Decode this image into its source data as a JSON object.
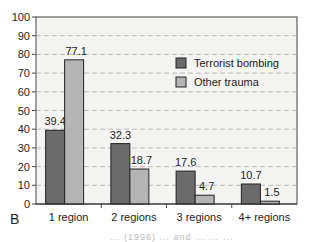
{
  "chart_data": {
    "type": "bar",
    "title": "",
    "xlabel": "",
    "ylabel": "",
    "ylim": [
      0,
      100
    ],
    "yticks": [
      0,
      10,
      20,
      30,
      40,
      50,
      60,
      70,
      80,
      90,
      100
    ],
    "grid": true,
    "legend_position": "upper right",
    "categories": [
      "1 region",
      "2 regions",
      "3 regions",
      "4+ regions"
    ],
    "series": [
      {
        "name": "Terrorist bombing",
        "color": "#6b6b6b",
        "values": [
          39.4,
          32.3,
          17.6,
          10.7
        ]
      },
      {
        "name": "Other trauma",
        "color": "#b4b4b4",
        "values": [
          77.1,
          18.7,
          4.7,
          1.5
        ]
      }
    ],
    "data_labels": [
      [
        "39.4",
        "32.3",
        "17.6",
        "10.7"
      ],
      [
        "77.1",
        "18.7",
        "4.7",
        "1.5"
      ]
    ]
  },
  "panel_label": "B",
  "caption_fragment": "... (1996) ... and ... ... ..."
}
